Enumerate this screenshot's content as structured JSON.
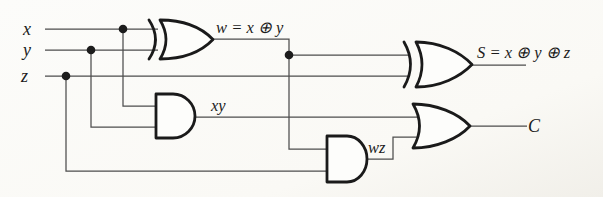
{
  "circuit": {
    "inputs": [
      {
        "label": "x"
      },
      {
        "label": "y"
      },
      {
        "label": "z"
      }
    ],
    "signals": {
      "w": "w = x ⊕ y",
      "xy": "xy",
      "wz": "wz",
      "sum": "S = x ⊕ y ⊕ z",
      "carry": "C"
    },
    "gates": [
      {
        "id": "xor1",
        "type": "XOR",
        "inputs": [
          "x",
          "y"
        ],
        "output": "w"
      },
      {
        "id": "and1",
        "type": "AND",
        "inputs": [
          "x",
          "y"
        ],
        "output": "xy"
      },
      {
        "id": "and2",
        "type": "AND",
        "inputs": [
          "w",
          "z"
        ],
        "output": "wz"
      },
      {
        "id": "xor2",
        "type": "XOR",
        "inputs": [
          "w",
          "z"
        ],
        "output": "S"
      },
      {
        "id": "or1",
        "type": "OR",
        "inputs": [
          "xy",
          "wz"
        ],
        "output": "C"
      }
    ],
    "colors": {
      "gate_stroke": "#1a1a1a",
      "wire_stroke": "#4d4d4d",
      "label_ink": "#1c1c1c",
      "background": "#fbfaf6"
    }
  }
}
